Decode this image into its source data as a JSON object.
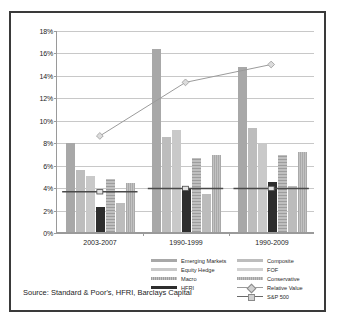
{
  "chart_data": {
    "type": "bar",
    "title": "",
    "xlabel": "",
    "ylabel": "",
    "ylim": [
      0,
      18
    ],
    "ytick_labels": [
      "0%",
      "2%",
      "4%",
      "6%",
      "8%",
      "10%",
      "12%",
      "14%",
      "16%",
      "18%"
    ],
    "ytick_values": [
      0,
      2,
      4,
      6,
      8,
      10,
      12,
      14,
      16,
      18
    ],
    "grid": true,
    "legend_position": "bottom",
    "categories": [
      "2003-2007",
      "1990-1999",
      "1990-2009"
    ],
    "series": [
      {
        "name": "Emerging Markets",
        "type": "bar",
        "values": [
          7.9,
          16.3,
          14.7
        ]
      },
      {
        "name": "Composite",
        "type": "bar",
        "values": [
          5.5,
          8.5,
          9.3
        ]
      },
      {
        "name": "Equity Hedge",
        "type": "bar",
        "values": [
          5.0,
          9.1,
          7.8
        ]
      },
      {
        "name": "FOF",
        "type": "bar",
        "values": [
          4.4,
          6.9,
          7.1
        ]
      },
      {
        "name": "Macro",
        "type": "bar",
        "values": [
          4.7,
          6.6,
          6.9
        ]
      },
      {
        "name": "Conservative",
        "type": "bar",
        "values": [
          2.6,
          3.4,
          4.1
        ]
      },
      {
        "name": "HFRI",
        "type": "bar",
        "values": [
          2.2,
          3.9,
          4.5
        ]
      },
      {
        "name": "Relative Value",
        "type": "line",
        "values": [
          8.6,
          13.4,
          15.0
        ]
      },
      {
        "name": "S&P 500",
        "type": "line",
        "values": [
          3.6,
          3.9,
          3.9
        ]
      }
    ]
  },
  "legend": {
    "left_column": [
      {
        "label": "Emerging Markets",
        "swatch": "bar-gray-dark"
      },
      {
        "label": "Equity Hedge",
        "swatch": "bar-gray-light"
      },
      {
        "label": "Macro",
        "swatch": "bar-hatched"
      },
      {
        "label": "HFRI",
        "swatch": "bar-black"
      }
    ],
    "right_column": [
      {
        "label": "Composite",
        "swatch": "bar-gray-mid"
      },
      {
        "label": "FOF",
        "swatch": "bar-gray-pale"
      },
      {
        "label": "Conservative",
        "swatch": "bar-gray-mid2"
      },
      {
        "label": "Relative Value",
        "swatch": "line-diamond-marker"
      },
      {
        "label": "S&P 500",
        "swatch": "line-square-marker"
      }
    ]
  },
  "source": {
    "text": "Source: Standard & Poor's, HFRI, Barclays Capital"
  },
  "colors": {
    "frame": "#3a3a3a",
    "grid": "#c8c8c8",
    "axis": "#9a9a9a",
    "hfri_bar": "#2e2e2e",
    "relative_value_line": "#9a9a9a",
    "sp500_line": "#4a4a4a"
  }
}
